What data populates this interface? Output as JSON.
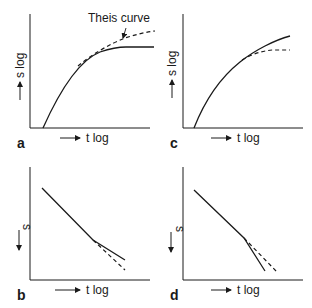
{
  "figure": {
    "panels": [
      {
        "id": "a",
        "letter": "a",
        "xlabel": "t log",
        "ylabel": "s log",
        "annotation": "Theis curve",
        "solid_desc": "observed drawdown, flattening below Theis curve",
        "dashed_desc": "Theis curve"
      },
      {
        "id": "b",
        "letter": "b",
        "xlabel": "t log",
        "ylabel": "s",
        "solid_desc": "straight line, slope decreases at late time",
        "dashed_desc": "extrapolated straight line"
      },
      {
        "id": "c",
        "letter": "c",
        "xlabel": "t log",
        "ylabel": "s log",
        "solid_desc": "observed drawdown rising above reference",
        "dashed_desc": "reference curve flattening"
      },
      {
        "id": "d",
        "letter": "d",
        "xlabel": "t log",
        "ylabel": "s",
        "solid_desc": "straight line, slope increases at late time",
        "dashed_desc": "extrapolated straight line"
      }
    ]
  },
  "colors": {
    "ink": "#1a1a1a",
    "background": "#ffffff"
  }
}
